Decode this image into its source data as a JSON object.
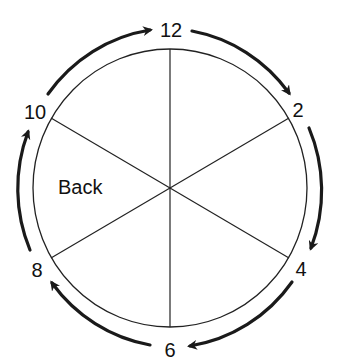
{
  "diagram": {
    "type": "clock-cycle",
    "sector_label": "Back",
    "labels": {
      "n12": "12",
      "n2": "2",
      "n4": "4",
      "n6": "6",
      "n8": "8",
      "n10": "10"
    },
    "arrow_direction": "clockwise",
    "colors": {
      "stroke": "#1a1a1a",
      "background": "#ffffff"
    }
  }
}
